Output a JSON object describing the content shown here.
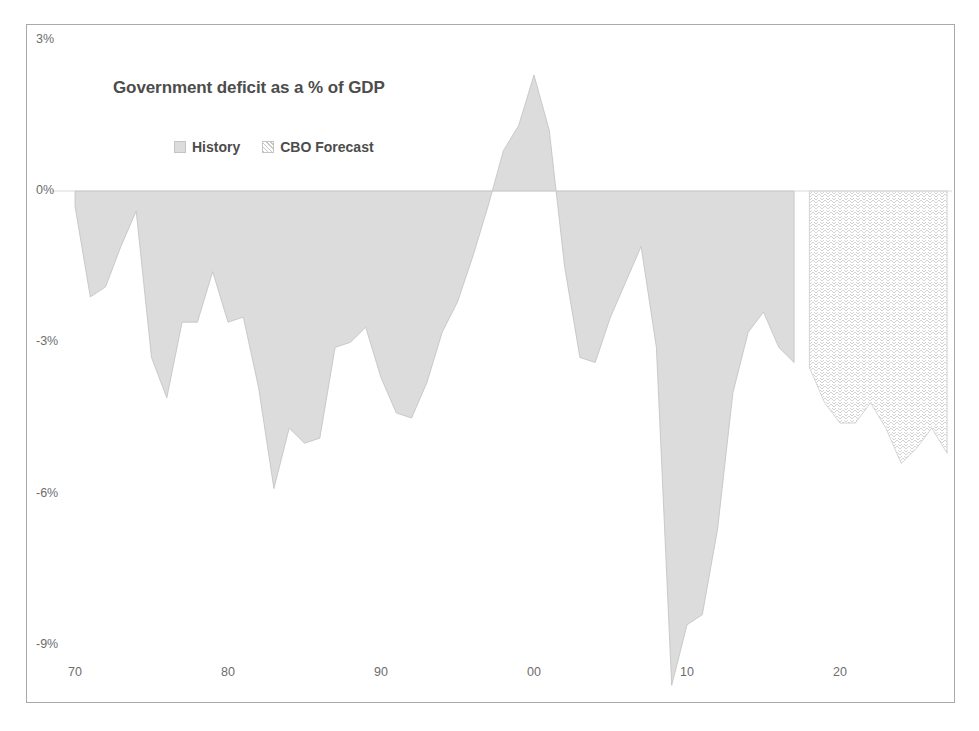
{
  "chart_data": {
    "type": "area",
    "title": "Government deficit as a % of GDP",
    "xlabel": "",
    "ylabel": "",
    "ylim": [
      -9,
      3
    ],
    "xlim": [
      1970,
      2027
    ],
    "grid": false,
    "legend_position": "top-center",
    "y_ticks": [
      "3%",
      "0%",
      "-3%",
      "-6%",
      "-9%"
    ],
    "y_tick_values": [
      3,
      0,
      -3,
      -6,
      -9
    ],
    "x_ticks": [
      "70",
      "80",
      "90",
      "00",
      "10",
      "20"
    ],
    "x_tick_values": [
      1970,
      1980,
      1990,
      2000,
      2010,
      2020
    ],
    "legend": [
      {
        "label": "History",
        "fill": "#dcdcdc",
        "pattern": "solid"
      },
      {
        "label": "CBO Forecast",
        "fill": "#ffffff",
        "pattern": "hatched"
      }
    ],
    "series": [
      {
        "name": "History",
        "fill": "#dcdcdc",
        "x": [
          1970,
          1971,
          1972,
          1973,
          1974,
          1975,
          1976,
          1977,
          1978,
          1979,
          1980,
          1981,
          1982,
          1983,
          1984,
          1985,
          1986,
          1987,
          1988,
          1989,
          1990,
          1991,
          1992,
          1993,
          1994,
          1995,
          1996,
          1997,
          1998,
          1999,
          2000,
          2001,
          2002,
          2003,
          2004,
          2005,
          2006,
          2007,
          2008,
          2009,
          2010,
          2011,
          2012,
          2013,
          2014,
          2015,
          2016,
          2017
        ],
        "values": [
          -0.3,
          -2.1,
          -1.9,
          -1.1,
          -0.4,
          -3.3,
          -4.1,
          -2.6,
          -2.6,
          -1.6,
          -2.6,
          -2.5,
          -3.9,
          -5.9,
          -4.7,
          -5.0,
          -4.9,
          -3.1,
          -3.0,
          -2.7,
          -3.7,
          -4.4,
          -4.5,
          -3.8,
          -2.8,
          -2.2,
          -1.3,
          -0.3,
          0.8,
          1.3,
          2.3,
          1.2,
          -1.5,
          -3.3,
          -3.4,
          -2.5,
          -1.8,
          -1.1,
          -3.1,
          -9.8,
          -8.6,
          -8.4,
          -6.7,
          -4.0,
          -2.8,
          -2.4,
          -3.1,
          -3.4
        ]
      },
      {
        "name": "CBO Forecast",
        "fill": "#ffffff",
        "pattern": "hatched",
        "x": [
          2018,
          2019,
          2020,
          2021,
          2022,
          2023,
          2024,
          2025,
          2026,
          2027
        ],
        "values": [
          -3.5,
          -4.2,
          -4.6,
          -4.6,
          -4.2,
          -4.7,
          -5.4,
          -5.1,
          -4.7,
          -5.2
        ]
      }
    ]
  },
  "frame": {
    "border_color": "#a9a9a9",
    "background": "#ffffff"
  }
}
